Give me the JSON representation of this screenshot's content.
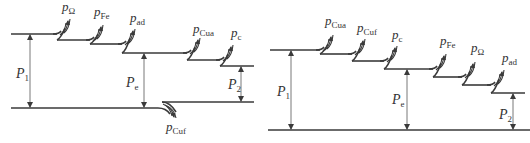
{
  "diagrams": [
    {
      "name": "power-flow-generator",
      "top_start": {
        "x": 11,
        "y": 34
      },
      "steps": [
        {
          "x0": 11,
          "x1": 57,
          "y": 34
        },
        {
          "x0": 57,
          "x1": 90,
          "y": 40
        },
        {
          "x0": 90,
          "x1": 122,
          "y": 44
        },
        {
          "x0": 122,
          "x1": 187,
          "y": 53
        },
        {
          "x0": 187,
          "x1": 220,
          "y": 60
        },
        {
          "x0": 220,
          "x1": 254,
          "y": 66
        }
      ],
      "losses": [
        {
          "at_x": 57,
          "from_y": 34,
          "to_y": 40,
          "label": "p",
          "sub": "Ω",
          "lx": 62,
          "ly": 11
        },
        {
          "at_x": 90,
          "from_y": 40,
          "to_y": 44,
          "label": "p",
          "sub": "Fe",
          "lx": 94,
          "ly": 16
        },
        {
          "at_x": 122,
          "from_y": 44,
          "to_y": 53,
          "label": "p",
          "sub": "ad",
          "lx": 130,
          "ly": 22
        },
        {
          "at_x": 187,
          "from_y": 53,
          "to_y": 60,
          "label": "p",
          "sub": "Cua",
          "lx": 193,
          "ly": 33
        },
        {
          "at_x": 220,
          "from_y": 60,
          "to_y": 66,
          "label": "p",
          "sub": "c",
          "lx": 231,
          "ly": 37
        }
      ],
      "bottom": [
        {
          "x0": 11,
          "x1": 158,
          "y": 108
        },
        {
          "x0": 162,
          "x1": 254,
          "y": 102
        }
      ],
      "bottom_loss": {
        "label": "p",
        "sub": "Cuf",
        "lx": 166,
        "ly": 131
      },
      "arrows": [
        {
          "name": "P1",
          "x": 30,
          "y_top": 34,
          "y_bot": 108,
          "label": "P",
          "sub": "1",
          "lx": 16,
          "ly": 78
        },
        {
          "name": "Pe",
          "x": 144,
          "y_top": 53,
          "y_bot": 108,
          "label": "P",
          "sub": "e",
          "lx": 126,
          "ly": 87
        },
        {
          "name": "P2",
          "x": 241,
          "y_top": 66,
          "y_bot": 102,
          "label": "P",
          "sub": "2",
          "lx": 228,
          "ly": 89
        }
      ]
    },
    {
      "name": "power-flow-motor",
      "steps": [
        {
          "x0": 270,
          "x1": 320,
          "y": 50
        },
        {
          "x0": 320,
          "x1": 352,
          "y": 54
        },
        {
          "x0": 352,
          "x1": 384,
          "y": 61
        },
        {
          "x0": 384,
          "x1": 433,
          "y": 69
        },
        {
          "x0": 433,
          "x1": 462,
          "y": 77
        },
        {
          "x0": 462,
          "x1": 491,
          "y": 85
        },
        {
          "x0": 491,
          "x1": 525,
          "y": 93
        }
      ],
      "losses": [
        {
          "at_x": 320,
          "from_y": 50,
          "to_y": 54,
          "label": "p",
          "sub": "Cua",
          "lx": 325,
          "ly": 25
        },
        {
          "at_x": 352,
          "from_y": 54,
          "to_y": 61,
          "label": "p",
          "sub": "Cuf",
          "lx": 357,
          "ly": 32
        },
        {
          "at_x": 384,
          "from_y": 61,
          "to_y": 69,
          "label": "p",
          "sub": "c",
          "lx": 392,
          "ly": 39
        },
        {
          "at_x": 433,
          "from_y": 69,
          "to_y": 77,
          "label": "p",
          "sub": "Fe",
          "lx": 440,
          "ly": 45
        },
        {
          "at_x": 462,
          "from_y": 77,
          "to_y": 85,
          "label": "p",
          "sub": "Ω",
          "lx": 471,
          "ly": 52
        },
        {
          "at_x": 491,
          "from_y": 85,
          "to_y": 93,
          "label": "p",
          "sub": "ad",
          "lx": 502,
          "ly": 62
        }
      ],
      "bottom": [
        {
          "x0": 268,
          "x1": 530,
          "y": 130
        }
      ],
      "arrows": [
        {
          "name": "P1",
          "x": 291,
          "y_top": 50,
          "y_bot": 130,
          "label": "P",
          "sub": "1",
          "lx": 277,
          "ly": 96
        },
        {
          "name": "Pe",
          "x": 407,
          "y_top": 69,
          "y_bot": 130,
          "label": "P",
          "sub": "e",
          "lx": 392,
          "ly": 104
        },
        {
          "name": "P2",
          "x": 513,
          "y_top": 93,
          "y_bot": 130,
          "label": "P",
          "sub": "2",
          "lx": 499,
          "ly": 119
        }
      ]
    }
  ]
}
